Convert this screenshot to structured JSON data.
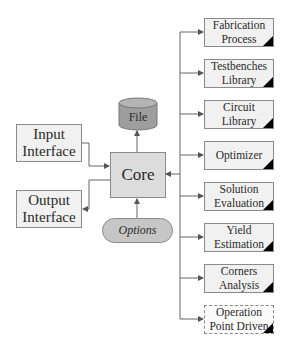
{
  "diagram": {
    "file": {
      "label": "File",
      "fill": "#9e9e9e"
    },
    "core": {
      "label": "Core"
    },
    "options": {
      "label": "Options"
    },
    "input_interface": {
      "label": "Input\nInterface"
    },
    "output_interface": {
      "label": "Output\nInterface"
    },
    "modules": [
      {
        "label": "Fabrication\nProcess",
        "style": "solid"
      },
      {
        "label": "Testbenches\nLibrary",
        "style": "solid"
      },
      {
        "label": "Circuit Library",
        "style": "solid"
      },
      {
        "label": "Optimizer",
        "style": "solid"
      },
      {
        "label": "Solution\nEvaluation",
        "style": "solid"
      },
      {
        "label": "Yield\nEstimation",
        "style": "solid"
      },
      {
        "label": "Corners\nAnalysis",
        "style": "solid"
      },
      {
        "label": "Operation\nPoint Driven",
        "style": "dashed"
      }
    ],
    "edges": [
      {
        "from": "Input Interface",
        "to": "Core"
      },
      {
        "from": "Core",
        "to": "Output Interface"
      },
      {
        "from": "Core",
        "to": "File"
      },
      {
        "from": "Options",
        "to": "Core"
      },
      {
        "from": "Modules bus",
        "to": "Core"
      },
      {
        "from": "Bus",
        "to": "Fabrication Process"
      },
      {
        "from": "Bus",
        "to": "Testbenches Library"
      },
      {
        "from": "Bus",
        "to": "Circuit Library"
      },
      {
        "from": "Bus",
        "to": "Optimizer"
      },
      {
        "from": "Bus",
        "to": "Solution Evaluation"
      },
      {
        "from": "Bus",
        "to": "Yield Estimation"
      },
      {
        "from": "Bus",
        "to": "Corners Analysis"
      },
      {
        "from": "Bus",
        "to": "Operation Point Driven"
      }
    ]
  }
}
